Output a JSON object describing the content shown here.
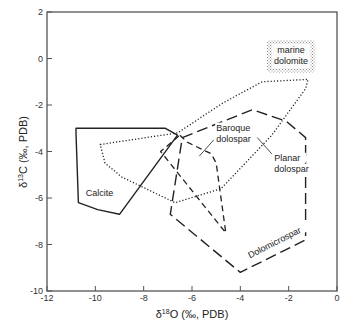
{
  "chart_data": {
    "type": "scatter",
    "title": "",
    "xlabel": {
      "prefix": "δ",
      "sup": "18",
      "rest": "O (‰, PDB)"
    },
    "ylabel": {
      "prefix": "δ",
      "sup": "13",
      "rest": "C (‰, PDB)"
    },
    "xlim": [
      -12,
      0
    ],
    "ylim": [
      -10,
      2
    ],
    "xticks": [
      -12,
      -10,
      -8,
      -6,
      -4,
      -2,
      0
    ],
    "yticks": [
      2,
      0,
      -2,
      -4,
      -6,
      -8,
      -10
    ],
    "grid": false,
    "fields": [
      {
        "name": "Calcite",
        "style": "solid",
        "points": [
          [
            -10.8,
            -3.0
          ],
          [
            -7.1,
            -3.0
          ],
          [
            -6.6,
            -3.3
          ],
          [
            -9.0,
            -6.7
          ],
          [
            -9.9,
            -6.5
          ],
          [
            -10.7,
            -6.2
          ],
          [
            -10.8,
            -3.2
          ]
        ]
      },
      {
        "name": "Planar dolospar",
        "style": "dotted",
        "points": [
          [
            -9.8,
            -3.7
          ],
          [
            -6.6,
            -3.2
          ],
          [
            -4.7,
            -1.9
          ],
          [
            -3.1,
            -1.0
          ],
          [
            -1.2,
            -0.9
          ],
          [
            -1.3,
            -1.3
          ],
          [
            -2.7,
            -3.3
          ],
          [
            -4.8,
            -5.6
          ],
          [
            -6.7,
            -6.2
          ],
          [
            -8.9,
            -5.1
          ],
          [
            -9.6,
            -4.5
          ]
        ]
      },
      {
        "name": "Baroque dolospar",
        "style": "dashed-medium",
        "points": [
          [
            -6.5,
            -3.3
          ],
          [
            -6.2,
            -3.6
          ],
          [
            -5.2,
            -4.1
          ],
          [
            -5.0,
            -4.5
          ],
          [
            -4.6,
            -7.5
          ],
          [
            -7.3,
            -4.0
          ],
          [
            -6.5,
            -3.3
          ]
        ]
      },
      {
        "name": "Dolomicrospar",
        "style": "dashed-long",
        "points": [
          [
            -6.4,
            -3.4
          ],
          [
            -3.5,
            -2.2
          ],
          [
            -2.1,
            -2.7
          ],
          [
            -1.3,
            -3.4
          ],
          [
            -1.3,
            -7.8
          ],
          [
            -4.0,
            -9.2
          ],
          [
            -6.9,
            -6.7
          ],
          [
            -6.4,
            -3.4
          ]
        ]
      }
    ],
    "annotations": [
      {
        "text": [
          "Calcite"
        ],
        "anchor": [
          -10.4,
          -5.9
        ]
      },
      {
        "text": [
          "Baroque",
          "dolospar"
        ],
        "anchor": [
          -5.0,
          -3.1
        ]
      },
      {
        "text": [
          "Planar",
          "dolospar"
        ],
        "anchor": [
          -2.6,
          -4.4
        ]
      },
      {
        "text": [
          "Dolomicrospar"
        ],
        "anchor": [
          -3.6,
          -8.6
        ],
        "rotation_deg": -27
      }
    ],
    "marine_dolomite_box": {
      "text": [
        "marine",
        "dolomite"
      ],
      "x_range": [
        -2.9,
        -0.9
      ],
      "y_range": [
        0.8,
        -0.6
      ],
      "fill": "stippled"
    }
  }
}
